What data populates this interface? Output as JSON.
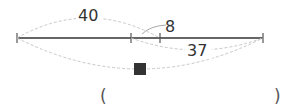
{
  "diagram": {
    "type": "segment-diagram",
    "segment_labels": {
      "whole_left_to_mid2": "40",
      "overlap": "8",
      "mid1_to_right": "37",
      "unknown": "■"
    },
    "answer_blank": {
      "open": "(",
      "close": ")",
      "value": ""
    },
    "colors": {
      "line": "#333333",
      "arc": "#c8c8c8",
      "text": "#333333",
      "square": "#333333"
    }
  }
}
